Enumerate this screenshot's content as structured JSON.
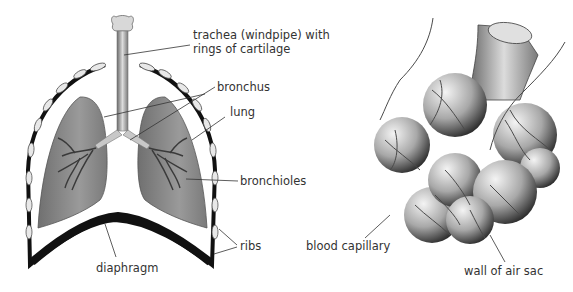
{
  "left_diagram": {
    "title": "Human respiratory system",
    "labels": {
      "trachea_line1": "trachea (windpipe) with",
      "trachea_line2": "rings of cartilage",
      "bronchus": "bronchus",
      "lung": "lung",
      "bronchioles": "bronchioles",
      "ribs": "ribs",
      "diaphragm": "diaphragm"
    }
  },
  "right_diagram": {
    "title": "Alveoli (air sacs)",
    "labels": {
      "blood_capillary": "blood capillary",
      "wall_of_air_sac": "wall of air sac"
    }
  },
  "colors": {
    "lung_fill": "#8a8a8a",
    "structure_fill": "#c8c8c8",
    "outline": "#111111",
    "text": "#333333",
    "background": "#ffffff"
  }
}
